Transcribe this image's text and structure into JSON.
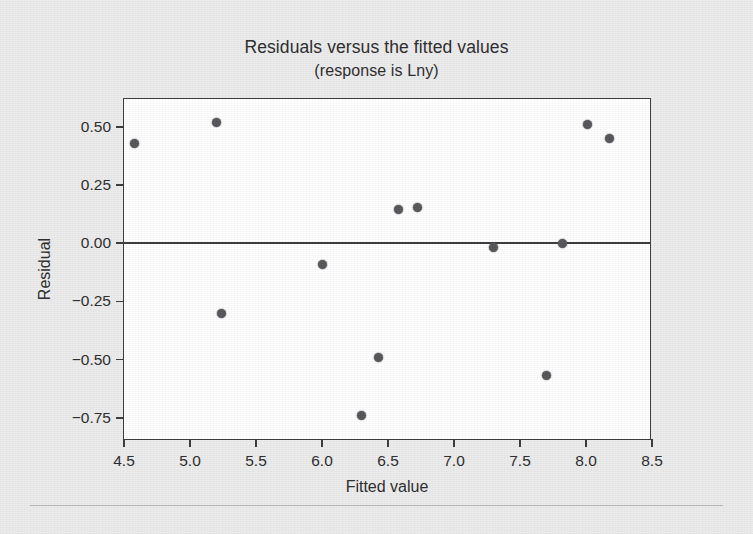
{
  "chart_data": {
    "type": "scatter",
    "title": "Residuals versus the fitted values",
    "subtitle": "(response is Lny)",
    "xlabel": "Fitted value",
    "ylabel": "Residual",
    "xlim": [
      4.5,
      8.5
    ],
    "ylim": [
      -0.85,
      0.62
    ],
    "grid": false,
    "legend": null,
    "reference_line": {
      "orientation": "horizontal",
      "value": 0.0
    },
    "xticks": [
      "4.5",
      "5.0",
      "5.5",
      "6.0",
      "6.5",
      "7.0",
      "7.5",
      "8.0",
      "8.5"
    ],
    "xtick_values": [
      4.5,
      5.0,
      5.5,
      6.0,
      6.5,
      7.0,
      7.5,
      8.0,
      8.5
    ],
    "yticks": [
      "0.50",
      "0.25",
      "0.00",
      "-0.25",
      "-0.50",
      "-0.75"
    ],
    "ytick_values": [
      0.5,
      0.25,
      0.0,
      -0.25,
      -0.5,
      -0.75
    ],
    "marker_color": "#56565a",
    "axis_color": "#3a3a3a",
    "plot_background": "#ffffff",
    "figure_background": "#ececed",
    "points": [
      {
        "x": 4.58,
        "y": 0.43
      },
      {
        "x": 5.2,
        "y": 0.52
      },
      {
        "x": 5.24,
        "y": -0.3
      },
      {
        "x": 6.0,
        "y": -0.09
      },
      {
        "x": 6.3,
        "y": -0.74
      },
      {
        "x": 6.43,
        "y": -0.49
      },
      {
        "x": 6.58,
        "y": 0.145
      },
      {
        "x": 6.72,
        "y": 0.155
      },
      {
        "x": 7.3,
        "y": -0.02
      },
      {
        "x": 7.7,
        "y": -0.57
      },
      {
        "x": 7.82,
        "y": 0.0
      },
      {
        "x": 8.01,
        "y": 0.51
      },
      {
        "x": 8.18,
        "y": 0.45
      }
    ]
  },
  "footer": {
    "smudge_text": ""
  }
}
